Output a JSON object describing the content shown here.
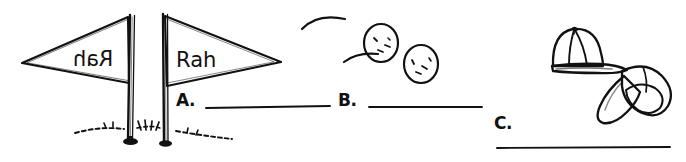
{
  "illustration": {
    "title": "cheer-items-worksheet",
    "background_color": "#ffffff",
    "ink_color": "#111111",
    "style": "hand-drawn black ink line art"
  },
  "flags": {
    "left": {
      "text": "Rah",
      "orientation": "mirrored, pointing left",
      "name": "pennant-flag-left"
    },
    "right": {
      "text": "Rah",
      "orientation": "normal, pointing right",
      "name": "pennant-flag-right"
    }
  },
  "ground": {
    "description": "dashed grass line with tufts"
  },
  "balls": {
    "count": 2,
    "description": "two tossed balls with motion arcs"
  },
  "caps": {
    "count": 2,
    "description": "two baseball caps, one upright and one tumbling"
  },
  "answers": [
    {
      "label": "A.",
      "value": "",
      "blank": true
    },
    {
      "label": "B.",
      "value": "",
      "blank": true
    },
    {
      "label": "C.",
      "value": "",
      "blank": true
    }
  ]
}
